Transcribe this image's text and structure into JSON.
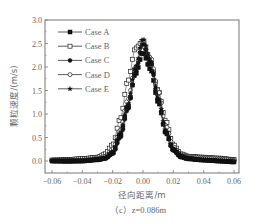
{
  "chart_data": {
    "type": "scatter",
    "title": "",
    "caption": "（c）z=0.086m",
    "xlabel": "径向距离/m",
    "ylabel": "颗粒速度/(m/s)",
    "xlim": [
      -0.065,
      0.065
    ],
    "ylim": [
      -0.25,
      3.0
    ],
    "xticks": [
      "-0.06",
      "-0.04",
      "-0.02",
      "0.00",
      "0.02",
      "0.04",
      "0.06"
    ],
    "yticks": [
      "0.0",
      "0.5",
      "1.0",
      "1.5",
      "2.0",
      "2.5",
      "3.0"
    ],
    "grid": false,
    "legend_position": "upper left",
    "x": [
      -0.06,
      -0.05,
      -0.04,
      -0.03,
      -0.025,
      -0.02,
      -0.015,
      -0.01,
      -0.005,
      0.0,
      0.005,
      0.01,
      0.015,
      0.02,
      0.025,
      0.03,
      0.04,
      0.05,
      0.06
    ],
    "series": [
      {
        "name": "Case A",
        "marker": "filled-square",
        "values": [
          0.0,
          0.0,
          0.0,
          0.03,
          0.06,
          0.18,
          0.55,
          1.15,
          1.85,
          2.3,
          1.95,
          1.25,
          0.6,
          0.25,
          0.1,
          0.05,
          0.02,
          0.0,
          -0.02
        ]
      },
      {
        "name": "Case B",
        "marker": "open-square",
        "values": [
          0.02,
          0.03,
          0.05,
          0.08,
          0.15,
          0.35,
          0.9,
          1.7,
          2.4,
          2.55,
          2.1,
          1.5,
          0.85,
          0.35,
          0.15,
          0.1,
          0.08,
          0.06,
          0.03
        ]
      },
      {
        "name": "Case C",
        "marker": "filled-circle",
        "values": [
          0.0,
          -0.01,
          0.0,
          0.02,
          0.05,
          0.15,
          0.5,
          1.1,
          1.9,
          2.5,
          2.1,
          1.3,
          0.6,
          0.22,
          0.08,
          0.04,
          0.02,
          0.0,
          -0.02
        ]
      },
      {
        "name": "Case D",
        "marker": "open-circle",
        "values": [
          0.01,
          0.01,
          0.02,
          0.05,
          0.1,
          0.25,
          0.65,
          1.3,
          2.0,
          2.45,
          2.2,
          1.5,
          0.75,
          0.3,
          0.12,
          0.08,
          0.06,
          0.04,
          0.02
        ]
      },
      {
        "name": "Case E",
        "marker": "star",
        "values": [
          0.0,
          0.0,
          0.01,
          0.03,
          0.07,
          0.2,
          0.6,
          1.2,
          2.0,
          2.6,
          2.15,
          1.35,
          0.65,
          0.25,
          0.1,
          0.05,
          0.03,
          0.01,
          0.0
        ]
      }
    ]
  }
}
